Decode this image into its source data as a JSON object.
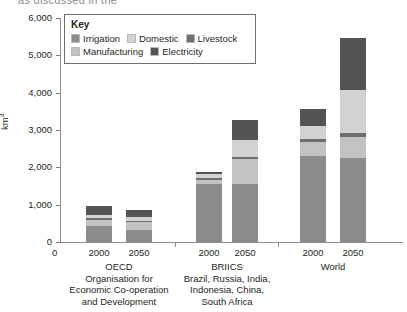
{
  "top_cut_text": "as discussed in the",
  "legend": {
    "title": "Key",
    "rows": [
      [
        {
          "label": "Irrigation",
          "color": "#8c8c8c"
        },
        {
          "label": "Domestic",
          "color": "#d2d2d2"
        },
        {
          "label": "Livestock",
          "color": "#6e6e6e"
        }
      ],
      [
        {
          "label": "Manufacturing",
          "color": "#c2c2c2"
        },
        {
          "label": "Electricity",
          "color": "#545454"
        }
      ]
    ]
  },
  "axes": {
    "y_label": "km",
    "y_label_sup": "3",
    "y_ticks": [
      "6,000",
      "5,000",
      "4,000",
      "3,000",
      "2,000",
      "1,000",
      "0"
    ],
    "x_zero": "0"
  },
  "groups": [
    {
      "name": "OECD",
      "sublabel": "Organisation for\nEconomic Co-operation\nand Development",
      "years": [
        "2000",
        "2050"
      ]
    },
    {
      "name": "BRIICS",
      "sublabel": "Brazil, Russia, India,\nIndonesia, China,\nSouth Africa",
      "years": [
        "2000",
        "2050"
      ]
    },
    {
      "name": "World",
      "sublabel": "",
      "years": [
        "2000",
        "2050"
      ]
    }
  ],
  "chart_data": {
    "type": "bar",
    "title": "",
    "subtitle": "",
    "xlabel": "",
    "ylabel": "km3",
    "ylim": [
      0,
      6000
    ],
    "yticks": [
      0,
      1000,
      2000,
      3000,
      4000,
      5000,
      6000
    ],
    "grid": false,
    "stacked": true,
    "legend_position": "inside-top-left",
    "categories": [
      "OECD 2000",
      "OECD 2050",
      "BRIICS 2000",
      "BRIICS 2050",
      "World 2000",
      "World 2050"
    ],
    "series": [
      {
        "name": "Irrigation",
        "color": "#8c8c8c",
        "values": [
          420,
          330,
          1560,
          1540,
          2290,
          2260
        ]
      },
      {
        "name": "Manufacturing",
        "color": "#c2c2c2",
        "values": [
          180,
          200,
          100,
          680,
          400,
          560
        ]
      },
      {
        "name": "Livestock",
        "color": "#6e6e6e",
        "values": [
          40,
          40,
          50,
          60,
          70,
          90
        ]
      },
      {
        "name": "Domestic",
        "color": "#d2d2d2",
        "values": [
          90,
          100,
          100,
          440,
          340,
          1160
        ]
      },
      {
        "name": "Electricity",
        "color": "#545454",
        "values": [
          230,
          180,
          70,
          560,
          460,
          1400
        ]
      }
    ],
    "totals": [
      960,
      850,
      1880,
      3280,
      3560,
      5470
    ]
  }
}
